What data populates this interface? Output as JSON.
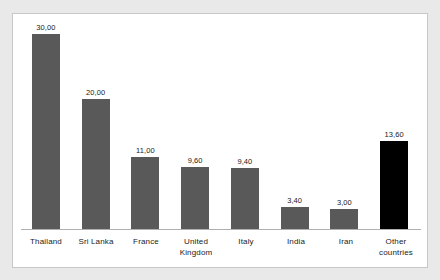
{
  "chart_data": {
    "type": "bar",
    "title": "",
    "subtitle": "",
    "xlabel": "",
    "ylabel": "",
    "grid": false,
    "legend": "none",
    "axis_line": true,
    "ylim": [
      0,
      30
    ],
    "decimal_separator": ",",
    "categories": [
      "Thailand",
      "Sri Lanka",
      "France",
      "United Kingdom",
      "Italy",
      "India",
      "Iran",
      "Other countries"
    ],
    "values": [
      30.0,
      20.0,
      11.0,
      9.6,
      9.4,
      3.4,
      3.0,
      13.6
    ],
    "value_labels": [
      "30,00",
      "20,00",
      "11,00",
      "9,60",
      "9,40",
      "3,40",
      "3,00",
      "13,60"
    ],
    "category_label_lines": [
      [
        "Thailand"
      ],
      [
        "Sri Lanka"
      ],
      [
        "France"
      ],
      [
        "United",
        "Kingdom"
      ],
      [
        "Italy"
      ],
      [
        "India"
      ],
      [
        "Iran"
      ],
      [
        "Other",
        "countries"
      ]
    ],
    "bar_colors": [
      "#595959",
      "#595959",
      "#595959",
      "#595959",
      "#595959",
      "#595959",
      "#595959",
      "#000000"
    ],
    "highlight_index": 7,
    "colors": {
      "bar_default": "#595959",
      "bar_highlight": "#000000",
      "axis_line": "#b0b0b0",
      "plot_background": "#ffffff",
      "page_background": "#e9e9e9",
      "frame_border": "#c8c8c8",
      "text": "#1a1a1a"
    }
  }
}
